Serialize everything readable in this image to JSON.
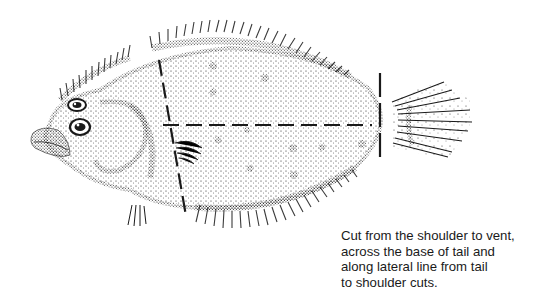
{
  "figure": {
    "style": "stipple illustration",
    "ink_color": "#1a1a1a",
    "background_color": "#ffffff",
    "cut_lines": [
      {
        "name": "shoulder-cut",
        "from": [
          159,
          60
        ],
        "to": [
          186,
          216
        ]
      },
      {
        "name": "lateral-line-cut",
        "from": [
          163,
          125
        ],
        "to": [
          372,
          125
        ]
      },
      {
        "name": "tail-base-cut",
        "from": [
          380,
          73
        ],
        "to": [
          380,
          157
        ]
      }
    ]
  },
  "caption": {
    "lines": [
      "Cut from the shoulder to vent,",
      "across the base of tail and",
      "along lateral line from tail",
      "to shoulder cuts."
    ]
  }
}
